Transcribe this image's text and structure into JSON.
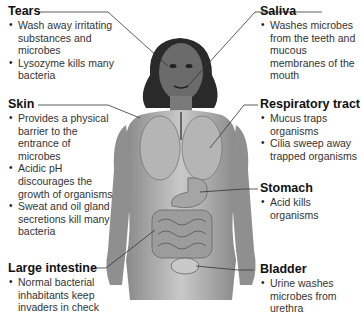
{
  "figure": {
    "illustration": "female human body with lungs, stomach, intestines and bladder visible",
    "leader_color": "#333333"
  },
  "labels": {
    "tears": {
      "title": "Tears",
      "bullets": [
        "Wash away irritating substances and microbes",
        "Lysozyme kills many bacteria"
      ]
    },
    "skin": {
      "title": "Skin",
      "bullets": [
        "Provides a physical barrier to the entrance of microbes",
        "Acidic pH discourages the growth of organisms",
        "Sweat and oil gland secretions kill many bacteria"
      ]
    },
    "large_intestine": {
      "title": "Large intestine",
      "bullets": [
        "Normal bacterial inhabitants keep invaders in check"
      ]
    },
    "saliva": {
      "title": "Saliva",
      "bullets": [
        "Washes microbes from the teeth and mucous membranes of the mouth"
      ]
    },
    "respiratory_tract": {
      "title": "Respiratory tract",
      "bullets": [
        "Mucus traps organisms",
        "Cilia sweep away trapped organisms"
      ]
    },
    "stomach": {
      "title": "Stomach",
      "bullets": [
        "Acid kills organisms"
      ]
    },
    "bladder": {
      "title": "Bladder",
      "bullets": [
        "Urine washes microbes from urethra"
      ]
    }
  }
}
